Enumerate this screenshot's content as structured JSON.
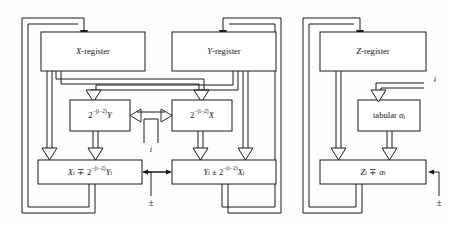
{
  "diagram": {
    "type": "block-diagram",
    "boxes": [
      {
        "id": "x-register",
        "label": "X-register",
        "section": "x"
      },
      {
        "id": "y-register",
        "label": "Y-register",
        "section": "y"
      },
      {
        "id": "z-register",
        "label": "Z-register",
        "section": "z"
      },
      {
        "id": "shift-y",
        "label": "2−(i−2)Y",
        "section": "x"
      },
      {
        "id": "shift-x",
        "label": "2−(i−2)X",
        "section": "y"
      },
      {
        "id": "tabular-alpha",
        "label": "tabular αi",
        "section": "z"
      },
      {
        "id": "adder-x",
        "label": "Xi ∓ 2−(i−2)Yi",
        "section": "x"
      },
      {
        "id": "adder-y",
        "label": "Yi ± 2−(i−2)Xi",
        "section": "y"
      },
      {
        "id": "adder-z",
        "label": "Zi ∓ αi",
        "section": "z"
      }
    ],
    "box_text": {
      "x_register": "X-register",
      "y_register": "Y-register",
      "z_register": "Z-register",
      "shift_y_base": "2",
      "shift_y_exp": "−(i−2)",
      "shift_y_var": "Y",
      "shift_x_base": "2",
      "shift_x_exp": "−(i−2)",
      "shift_x_var": "X",
      "tabular": "tabular",
      "tabular_var": "α",
      "tabular_sub": "i",
      "adder_x_lead": "X",
      "adder_x_lead_sub": "i",
      "adder_x_op": "∓",
      "adder_x_base": "2",
      "adder_x_exp": "−(i−2)",
      "adder_x_var": "Y",
      "adder_x_var_sub": "i",
      "adder_y_lead": "Y",
      "adder_y_lead_sub": "i",
      "adder_y_op": "±",
      "adder_y_base": "2",
      "adder_y_exp": "−(i−2)",
      "adder_y_var": "X",
      "adder_y_var_sub": "i",
      "adder_z_lead": "Z",
      "adder_z_lead_sub": "i",
      "adder_z_op": "∓",
      "adder_z_var": "α",
      "adder_z_var_sub": "i"
    },
    "signals": [
      {
        "id": "iter-index-center",
        "label": "i",
        "position": "center-bottom"
      },
      {
        "id": "iter-index-right",
        "label": "i",
        "position": "right-top"
      },
      {
        "id": "sign-center",
        "label": "±",
        "position": "center-bottom"
      },
      {
        "id": "sign-right",
        "label": "±",
        "position": "far-right-bottom"
      }
    ],
    "colors": {
      "line": "#1a1a1a",
      "box_fill": "#ffffff",
      "background": "#fdfdfb"
    }
  }
}
